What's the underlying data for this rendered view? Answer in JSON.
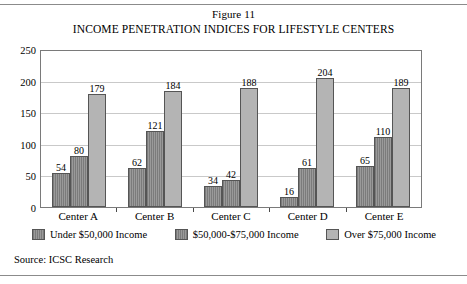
{
  "figure": {
    "number_label": "Figure 11",
    "title": "INCOME PENETRATION INDICES FOR LIFESTYLE CENTERS",
    "source": "Source: ICSC Research"
  },
  "chart_data": {
    "type": "bar",
    "title": "INCOME PENETRATION INDICES FOR LIFESTYLE CENTERS",
    "subtitle": "Figure 11",
    "xlabel": "",
    "ylabel": "",
    "ylim": [
      0,
      250
    ],
    "yticks": [
      0,
      50,
      100,
      150,
      200,
      250
    ],
    "grid": true,
    "legend_position": "bottom",
    "categories": [
      "Center A",
      "Center B",
      "Center C",
      "Center D",
      "Center E"
    ],
    "series": [
      {
        "name": "Under $50,000 Income",
        "color": "#8f8f8f",
        "values": [
          54,
          62,
          34,
          16,
          65
        ]
      },
      {
        "name": "$50,000-$75,000 Income",
        "color": "#8f8f8f",
        "values": [
          80,
          121,
          42,
          61,
          110
        ]
      },
      {
        "name": "Over $75,000 Income",
        "color": "#b4b4b4",
        "values": [
          179,
          184,
          188,
          204,
          189
        ]
      }
    ],
    "source": "Source: ICSC Research"
  }
}
